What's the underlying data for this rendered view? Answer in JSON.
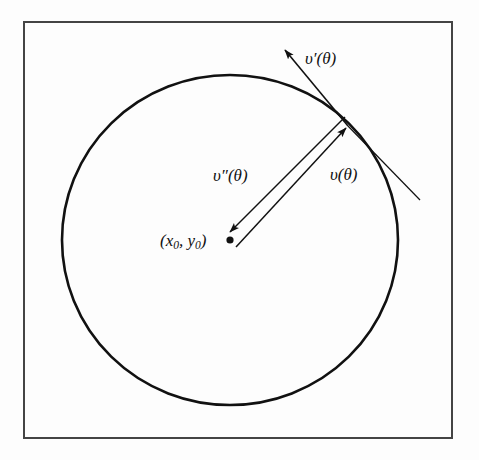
{
  "figure": {
    "type": "geometric-diagram",
    "title": "",
    "background_color": "#fdfdfd",
    "stroke_color": "#111111",
    "frame": {
      "name": "figure-border",
      "x": 24,
      "y": 22,
      "width": 428,
      "height": 416,
      "stroke_width": 2,
      "color": "#444444"
    },
    "circle": {
      "name": "circle-outline",
      "center_x": 230,
      "center_y": 240,
      "radius_x": 168,
      "radius_y": 165,
      "stroke_width": 2.6,
      "color": "#111111",
      "fill": "none"
    },
    "center_point": {
      "name": "center-dot",
      "x": 230,
      "y": 240,
      "radius": 3.6,
      "color": "#111111"
    },
    "tangent_point": {
      "x": 348,
      "y": 126
    },
    "vectors": [
      {
        "id": "v",
        "label": "υ(θ)",
        "description": "radius vector from center to point on circle",
        "from_x": 236,
        "from_y": 247,
        "to_x": 348,
        "to_y": 126,
        "stroke_width": 1.5,
        "arrowhead": "end"
      },
      {
        "id": "v-double-prime",
        "label": "υ″(θ)",
        "description": "vector from point on circle back toward the center",
        "from_x": 345,
        "from_y": 117,
        "to_x": 228,
        "to_y": 234,
        "stroke_width": 1.5,
        "arrowhead": "end"
      },
      {
        "id": "v-prime",
        "label": "υ′(θ)",
        "description": "tangent vector at the point on the circle",
        "from_x": 348,
        "from_y": 126,
        "to_x": 283,
        "to_y": 48,
        "stroke_width": 1.6,
        "arrowhead": "end"
      }
    ],
    "tangent_line": {
      "name": "tangent-line",
      "from_x": 348,
      "from_y": 126,
      "to_x": 420,
      "to_y": 200,
      "stroke_width": 1.2
    },
    "labels": {
      "v_prime": "υ′(θ)",
      "v": "υ(θ)",
      "v_double_prime": "υ″(θ)",
      "center_open_paren": "(",
      "center_x_symbol": "x",
      "center_x_subscript": "0",
      "center_separator": ", ",
      "center_y_symbol": "y",
      "center_y_subscript": "0",
      "center_close_paren": ")"
    }
  }
}
